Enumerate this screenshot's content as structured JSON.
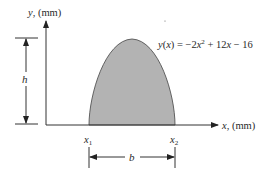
{
  "diagram": {
    "y_axis_label": "y, (mm)",
    "x_axis_label": "x, (mm)",
    "equation": {
      "lhs": "y(x)",
      "eq": "=",
      "term1": "−2x",
      "exp": "2",
      "rest": "+ 12x − 16",
      "full": "y(x) = −2x² + 12x − 16"
    },
    "height_label": "h",
    "base_label": "b",
    "x1_label": "x",
    "x1_sub": "1",
    "x2_label": "x",
    "x2_sub": "2",
    "colors": {
      "fill": "#b3b3b3",
      "stroke": "#555555",
      "line": "#333333"
    }
  }
}
